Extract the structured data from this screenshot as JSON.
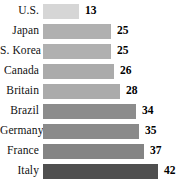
{
  "chart_data": {
    "type": "bar",
    "orientation": "horizontal",
    "title": "",
    "subtitle": "",
    "xlabel": "",
    "ylabel": "",
    "grid": false,
    "legend": null,
    "xlim": [
      0,
      42
    ],
    "axis_visible": false,
    "categories": [
      "U.S.",
      "Japan",
      "S. Korea",
      "Canada",
      "Britain",
      "Brazil",
      "Germany",
      "France",
      "Italy"
    ],
    "values": [
      13,
      25,
      25,
      26,
      28,
      34,
      35,
      37,
      42
    ],
    "value_labels": [
      "13",
      "25",
      "25",
      "26",
      "28",
      "34",
      "35",
      "37",
      "42"
    ],
    "bar_colors": [
      "#d6d6d6",
      "#b0b0b0",
      "#b0b0b0",
      "#ababab",
      "#ababab",
      "#8c8c8c",
      "#8a8a8a",
      "#848484",
      "#4f4f4f"
    ],
    "rows": [
      {
        "label": "U.S.",
        "value": 13,
        "value_label": "13",
        "color": "#d6d6d6"
      },
      {
        "label": "Japan",
        "value": 25,
        "value_label": "25",
        "color": "#b0b0b0"
      },
      {
        "label": "S. Korea",
        "value": 25,
        "value_label": "25",
        "color": "#b0b0b0"
      },
      {
        "label": "Canada",
        "value": 26,
        "value_label": "26",
        "color": "#ababab"
      },
      {
        "label": "Britain",
        "value": 28,
        "value_label": "28",
        "color": "#ababab"
      },
      {
        "label": "Brazil",
        "value": 34,
        "value_label": "34",
        "color": "#8c8c8c"
      },
      {
        "label": "Germany",
        "value": 35,
        "value_label": "35",
        "color": "#8a8a8a"
      },
      {
        "label": "France",
        "value": 37,
        "value_label": "37",
        "color": "#848484"
      },
      {
        "label": "Italy",
        "value": 42,
        "value_label": "42",
        "color": "#4f4f4f"
      }
    ]
  },
  "layout": {
    "bar_origin_px": 47,
    "max_bar_px": 115,
    "row_height_px": 20,
    "first_row_top_px": 1,
    "bar_thickness_px": 15
  }
}
